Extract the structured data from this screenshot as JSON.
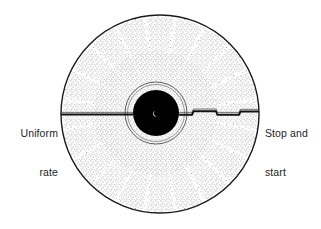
{
  "figure": {
    "background_color": "#ffffff",
    "ink_color": "#1a1a1a",
    "hub_color": "#000000",
    "stipple_color": "#555555",
    "disc": {
      "center_x": 160,
      "center_y": 114,
      "radius": 100,
      "outline_width": 1.4
    },
    "hub": {
      "center_x": 156,
      "center_y": 113,
      "radius": 23,
      "ring_radius": 31,
      "spindle_spot": "visible"
    }
  },
  "annotations": {
    "left": {
      "name": "uniform-rate",
      "line1": "Uniform",
      "line2": "rate",
      "align": "right",
      "groove_style": "straight"
    },
    "right": {
      "name": "stop-and-start",
      "line1": "Stop and",
      "line2": "start",
      "align": "left",
      "groove_style": "stepped"
    }
  },
  "grooves": {
    "uniform_groove_label": "uniform-rate-groove",
    "stepped_groove_label": "stop-and-start-groove"
  }
}
